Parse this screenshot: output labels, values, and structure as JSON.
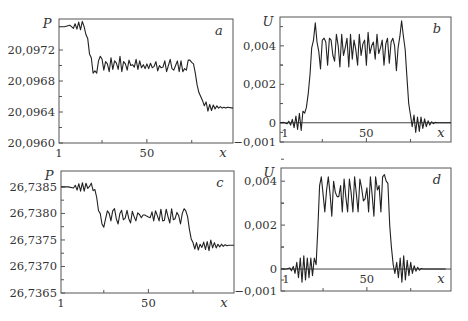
{
  "chart_data": [
    {
      "panel": "a",
      "type": "line",
      "xlabel": "x",
      "ylabel": "P",
      "xlim": [
        1,
        98
      ],
      "ylim": [
        20.096,
        20.0976
      ],
      "xticks": [
        "1",
        "50"
      ],
      "yticks": [
        {
          "value": 20.096,
          "label": "20,0960"
        },
        {
          "value": 20.0964,
          "label": "20,0964"
        },
        {
          "value": 20.0968,
          "label": "20,0968"
        },
        {
          "value": 20.0972,
          "label": "20,0972"
        }
      ],
      "frame": {
        "left": 59,
        "top": 19,
        "right": 233,
        "bottom": 143
      },
      "series": [
        {
          "name": "P",
          "x": [
            1,
            4,
            7,
            9,
            10,
            11,
            12,
            13,
            14,
            15,
            16,
            17,
            18,
            19,
            20,
            21,
            22,
            23,
            24,
            25,
            26,
            27,
            28,
            29,
            30,
            31,
            32,
            33,
            34,
            35,
            36,
            37,
            38,
            39,
            40,
            41,
            42,
            43,
            44,
            45,
            46,
            47,
            48,
            49,
            50,
            51,
            52,
            53,
            54,
            55,
            56,
            57,
            58,
            59,
            60,
            61,
            62,
            63,
            64,
            65,
            66,
            67,
            68,
            69,
            70,
            71,
            72,
            73,
            74,
            75,
            76,
            77,
            78,
            79,
            80,
            81,
            82,
            83,
            84,
            85,
            86,
            87,
            88,
            89,
            90,
            91,
            92,
            93,
            94,
            95,
            98
          ],
          "y": [
            20.0975,
            20.0975,
            20.09752,
            20.09748,
            20.09754,
            20.09747,
            20.09756,
            20.09746,
            20.09757,
            20.0975,
            20.0974,
            20.09735,
            20.09715,
            20.0971,
            20.0969,
            20.09693,
            20.0969,
            20.09706,
            20.09712,
            20.09708,
            20.09694,
            20.09705,
            20.09702,
            20.09692,
            20.0971,
            20.09695,
            20.09706,
            20.09703,
            20.09695,
            20.09712,
            20.09692,
            20.09705,
            20.09702,
            20.09694,
            20.09707,
            20.097,
            20.09701,
            20.09698,
            20.09708,
            20.09695,
            20.09706,
            20.09697,
            20.09701,
            20.09696,
            20.09702,
            20.09696,
            20.09703,
            20.09697,
            20.09699,
            20.09705,
            20.09693,
            20.097,
            20.09697,
            20.09698,
            20.09706,
            20.09692,
            20.097,
            20.09708,
            20.09696,
            20.09694,
            20.097,
            20.09706,
            20.09692,
            20.09706,
            20.09692,
            20.09696,
            20.09694,
            20.09707,
            20.09707,
            20.09704,
            20.09702,
            20.0969,
            20.09675,
            20.09665,
            20.0966,
            20.09655,
            20.09648,
            20.09653,
            20.09641,
            20.0965,
            20.09642,
            20.09649,
            20.09644,
            20.09648,
            20.09645,
            20.09647,
            20.09645,
            20.09646,
            20.09645,
            20.09646,
            20.09645
          ]
        }
      ]
    },
    {
      "panel": "b",
      "type": "line",
      "xlabel": "x",
      "ylabel": "U",
      "xlim": [
        1,
        98
      ],
      "ylim": [
        -0.001,
        0.0055
      ],
      "xticks": [
        "1",
        "50"
      ],
      "yticks": [
        {
          "value": -0.001,
          "label": "−0,001"
        },
        {
          "value": 0,
          "label": "0"
        },
        {
          "value": 0.002,
          "label": "0,002"
        },
        {
          "value": 0.004,
          "label": "0,004"
        }
      ],
      "frame": {
        "left": 280,
        "top": 17,
        "right": 451,
        "bottom": 142
      },
      "zero_line": true,
      "series": [
        {
          "name": "U",
          "x": [
            1,
            3,
            5,
            6,
            7,
            8,
            9,
            10,
            11,
            12,
            13,
            14,
            15,
            16,
            17,
            18,
            19,
            20,
            21,
            22,
            23,
            24,
            25,
            26,
            27,
            28,
            29,
            30,
            31,
            32,
            33,
            34,
            35,
            36,
            37,
            38,
            39,
            40,
            41,
            42,
            43,
            44,
            45,
            46,
            47,
            48,
            49,
            50,
            51,
            52,
            53,
            54,
            55,
            56,
            57,
            58,
            59,
            60,
            61,
            62,
            63,
            64,
            65,
            66,
            67,
            68,
            69,
            70,
            71,
            72,
            73,
            74,
            75,
            76,
            77,
            78,
            79,
            80,
            81,
            82,
            83,
            84,
            85,
            86,
            87,
            88,
            89,
            90,
            91,
            92,
            93,
            95,
            98
          ],
          "y": [
            0,
            2e-05,
            -5e-05,
            8e-05,
            -0.00012,
            0.00018,
            -0.00025,
            0.00035,
            -0.00035,
            0.0005,
            -0.0004,
            0.0006,
            0.0005,
            0.0008,
            0.0015,
            0.0025,
            0.0039,
            0.0043,
            0.0052,
            0.0042,
            0.0037,
            0.0028,
            0.0043,
            0.0044,
            0.0042,
            0.003,
            0.0044,
            0.0043,
            0.0035,
            0.0032,
            0.0046,
            0.004,
            0.0029,
            0.0046,
            0.0035,
            0.0039,
            0.0044,
            0.0029,
            0.0046,
            0.0033,
            0.0043,
            0.0038,
            0.003,
            0.0046,
            0.0035,
            0.0041,
            0.0043,
            0.003,
            0.0047,
            0.0036,
            0.004,
            0.0042,
            0.0033,
            0.0046,
            0.0036,
            0.0039,
            0.0043,
            0.003,
            0.0041,
            0.0044,
            0.0031,
            0.0042,
            0.0044,
            0.004,
            0.0027,
            0.0039,
            0.0045,
            0.0053,
            0.0045,
            0.0038,
            0.0024,
            0.001,
            0.0004,
            -0.0002,
            0.0004,
            -0.0005,
            0.0003,
            -0.00045,
            0.0003,
            -0.0003,
            0.0002,
            -0.0002,
            0.0001,
            -0.00012,
            5e-05,
            -5e-05,
            2e-05,
            0,
            0,
            0,
            0,
            0,
            0
          ]
        }
      ]
    },
    {
      "panel": "c",
      "type": "line",
      "xlabel": "x",
      "ylabel": "P",
      "xlim": [
        1,
        98
      ],
      "ylim": [
        26.7365,
        26.7388
      ],
      "xticks": [
        "1",
        "50"
      ],
      "yticks": [
        {
          "value": 26.7365,
          "label": "26,7365"
        },
        {
          "value": 26.737,
          "label": "26,7370"
        },
        {
          "value": 26.7375,
          "label": "26,7375"
        },
        {
          "value": 26.738,
          "label": "26,7380"
        },
        {
          "value": 26.7385,
          "label": "26,7385"
        }
      ],
      "frame": {
        "left": 61,
        "top": 171,
        "right": 234,
        "bottom": 293
      },
      "series": [
        {
          "name": "P",
          "x": [
            1,
            5,
            8,
            9,
            10,
            11,
            12,
            13,
            14,
            15,
            16,
            17,
            18,
            19,
            20,
            21,
            22,
            23,
            24,
            25,
            26,
            27,
            28,
            29,
            30,
            31,
            32,
            33,
            34,
            35,
            36,
            37,
            38,
            39,
            40,
            41,
            42,
            43,
            44,
            45,
            46,
            47,
            48,
            49,
            50,
            51,
            52,
            53,
            54,
            55,
            56,
            57,
            58,
            59,
            60,
            61,
            62,
            63,
            64,
            65,
            66,
            67,
            68,
            69,
            70,
            71,
            72,
            73,
            74,
            75,
            76,
            77,
            78,
            79,
            80,
            81,
            82,
            83,
            84,
            85,
            86,
            87,
            88,
            89,
            90,
            91,
            92,
            93,
            94,
            95,
            98
          ],
          "y": [
            26.7385,
            26.7385,
            26.73848,
            26.73853,
            26.73844,
            26.73856,
            26.73842,
            26.73858,
            26.73842,
            26.73857,
            26.73847,
            26.73851,
            26.73857,
            26.73843,
            26.73845,
            26.7383,
            26.73805,
            26.738,
            26.7378,
            26.73774,
            26.7379,
            26.73805,
            26.738,
            26.73786,
            26.73805,
            26.73809,
            26.7379,
            26.7378,
            26.738,
            26.73806,
            26.73788,
            26.73791,
            26.73806,
            26.7379,
            26.73782,
            26.73804,
            26.73794,
            26.73786,
            26.73801,
            26.73798,
            26.73792,
            26.73797,
            26.73797,
            26.73795,
            26.73793,
            26.73792,
            26.73803,
            26.73786,
            26.73805,
            26.73796,
            26.73786,
            26.73808,
            26.73786,
            26.73787,
            26.73808,
            26.73794,
            26.73782,
            26.73809,
            26.73788,
            26.7379,
            26.73802,
            26.73796,
            26.7378,
            26.738,
            26.73809,
            26.73805,
            26.73794,
            26.7377,
            26.73752,
            26.73745,
            26.73733,
            26.73745,
            26.73731,
            26.73742,
            26.73736,
            26.73746,
            26.73732,
            26.73747,
            26.7373,
            26.7375,
            26.73735,
            26.73745,
            26.73735,
            26.73742,
            26.73737,
            26.73742,
            26.73738,
            26.73741,
            26.73739,
            26.7374,
            26.7374
          ]
        }
      ]
    },
    {
      "panel": "d",
      "type": "line",
      "xlabel": "x",
      "ylabel": "U",
      "xlim": [
        1,
        98
      ],
      "ylim": [
        -0.001,
        0.0046
      ],
      "xticks": [
        "1",
        "50"
      ],
      "yticks": [
        {
          "value": -0.001,
          "label": "−0,001"
        },
        {
          "value": 0,
          "label": "0"
        },
        {
          "value": 0.002,
          "label": "0,002"
        },
        {
          "value": 0.004,
          "label": "0,004"
        }
      ],
      "frame": {
        "left": 281,
        "top": 168,
        "right": 451,
        "bottom": 291
      },
      "zero_line": true,
      "series": [
        {
          "name": "U",
          "x": [
            1,
            4,
            6,
            7,
            8,
            9,
            10,
            11,
            12,
            13,
            14,
            15,
            16,
            17,
            18,
            19,
            20,
            21,
            22,
            23,
            24,
            25,
            26,
            27,
            28,
            29,
            30,
            31,
            32,
            33,
            34,
            35,
            36,
            37,
            38,
            39,
            40,
            41,
            42,
            43,
            44,
            45,
            46,
            47,
            48,
            49,
            50,
            51,
            52,
            53,
            54,
            55,
            56,
            57,
            58,
            59,
            60,
            61,
            62,
            63,
            64,
            65,
            66,
            67,
            68,
            69,
            70,
            71,
            72,
            73,
            74,
            75,
            76,
            77,
            78,
            79,
            80,
            81,
            82,
            83,
            84,
            85,
            86,
            87,
            88,
            89,
            90,
            91,
            92,
            93,
            95,
            98
          ],
          "y": [
            0,
            0,
            5e-05,
            -8e-05,
            0.00012,
            -0.0002,
            0.0003,
            -0.0004,
            0.0005,
            -0.0006,
            0.0006,
            -0.0005,
            0.0005,
            -0.0004,
            0.0005,
            -0.0003,
            0.0005,
            0.0002,
            0.0018,
            0.0038,
            0.0042,
            0.0034,
            0.0026,
            0.0036,
            0.0042,
            0.0034,
            0.0024,
            0.004,
            0.0035,
            0.0033,
            0.0033,
            0.0038,
            0.0026,
            0.0041,
            0.0033,
            0.0026,
            0.0041,
            0.0035,
            0.0026,
            0.0042,
            0.0034,
            0.0026,
            0.0041,
            0.0037,
            0.0031,
            0.0032,
            0.0037,
            0.0026,
            0.0042,
            0.0034,
            0.0024,
            0.0042,
            0.0036,
            0.0038,
            0.0026,
            0.0042,
            0.0043,
            0.004,
            0.0039,
            0.002,
            0.001,
            0.0002,
            -0.0002,
            0.0003,
            -0.0004,
            0.0005,
            -0.0006,
            0.0006,
            -0.0005,
            0.0004,
            -0.0003,
            0.0003,
            -0.0002,
            0.00015,
            -0.0001,
            8e-05,
            -5e-05,
            3e-05,
            0,
            0,
            0,
            0,
            0,
            0,
            0,
            0,
            0,
            0,
            0,
            0,
            0
          ]
        }
      ]
    }
  ],
  "labels": {
    "panel_a": "a",
    "panel_b": "b",
    "panel_c": "c",
    "panel_d": "d",
    "x_var": "x",
    "p_var": "P",
    "u_var": "U"
  }
}
